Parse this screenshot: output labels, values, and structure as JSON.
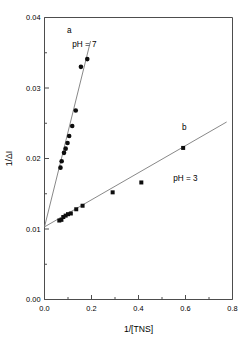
{
  "figure": {
    "background": "#ffffff",
    "frame_color": "#4d4d4d",
    "marker_color": "#0d0d0d",
    "line_color": "#7a7a7a"
  },
  "chart_data": {
    "type": "scatter",
    "title": "",
    "xlabel": "1/[TNS]",
    "ylabel": "1/ΔI",
    "xlim": [
      0.0,
      0.8
    ],
    "ylim": [
      0.0,
      0.04
    ],
    "xticks": [
      0.0,
      0.2,
      0.4,
      0.6,
      0.8
    ],
    "xtick_labels": [
      "0.0",
      "0.2",
      "0.4",
      "0.6",
      "0.8"
    ],
    "xticks_minor": [
      0.1,
      0.3,
      0.5,
      0.7
    ],
    "yticks": [
      0.0,
      0.01,
      0.02,
      0.03,
      0.04
    ],
    "ytick_labels": [
      "0.00",
      "0.01",
      "0.02",
      "0.03",
      "0.04"
    ],
    "yticks_minor": [
      0.005,
      0.015,
      0.025,
      0.035
    ],
    "grid": false,
    "legend": "none",
    "common_intercept": 0.0103,
    "series": [
      {
        "name": "a",
        "label": "pH = 7",
        "marker": "circle",
        "marker_size": 4.6,
        "color": "#0d0d0d",
        "fit_slope": 0.1345,
        "fit_intercept": 0.0103,
        "fit_x_range": [
          0.0,
          0.196
        ],
        "x": [
          0.068,
          0.073,
          0.083,
          0.09,
          0.098,
          0.105,
          0.118,
          0.133,
          0.155,
          0.182
        ],
        "y": [
          0.0187,
          0.0196,
          0.0208,
          0.0214,
          0.0222,
          0.0232,
          0.0246,
          0.0268,
          0.033,
          0.0341
        ]
      },
      {
        "name": "b",
        "label": "pH = 3",
        "marker": "square",
        "marker_size": 4.0,
        "color": "#0d0d0d",
        "fit_slope": 0.0192,
        "fit_intercept": 0.0103,
        "fit_x_range": [
          0.0,
          0.775
        ],
        "x": [
          0.063,
          0.072,
          0.08,
          0.09,
          0.1,
          0.112,
          0.135,
          0.162,
          0.29,
          0.412,
          0.59
        ],
        "y": [
          0.0112,
          0.0113,
          0.0117,
          0.0119,
          0.0121,
          0.0122,
          0.0128,
          0.0133,
          0.0152,
          0.0166,
          0.0215
        ]
      }
    ],
    "annotations": [
      {
        "text": "a",
        "x": 0.105,
        "y": 0.0378,
        "name": "curve-label-a"
      },
      {
        "text": "pH = 7",
        "x": 0.17,
        "y": 0.0358,
        "name": "annotation-ph7"
      },
      {
        "text": "b",
        "x": 0.595,
        "y": 0.024,
        "name": "curve-label-b"
      },
      {
        "text": "pH = 3",
        "x": 0.6,
        "y": 0.0168,
        "name": "annotation-ph3"
      }
    ]
  }
}
